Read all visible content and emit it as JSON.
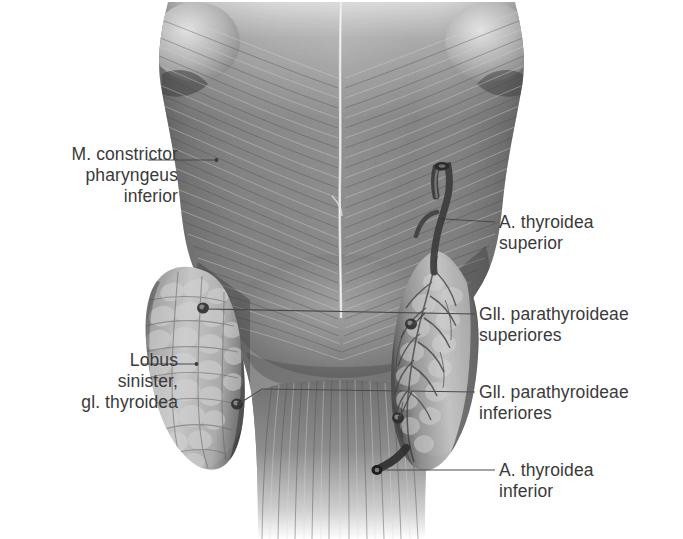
{
  "figure": {
    "type": "anatomical-illustration",
    "view": "posterior view of pharynx and thyroid gland",
    "palette": {
      "background": "#ffffff",
      "label_text": "#3a3a3a",
      "leader_line": "#4a4a4a",
      "muscle_mid": "#7a7a7a",
      "muscle_dark": "#4f4f4f",
      "muscle_light": "#c9c9c9",
      "gland_light": "#b9b9b9",
      "gland_dark": "#555555"
    }
  },
  "labels": [
    {
      "id": "m-constrictor-pharyngeus-inferior",
      "text": "M. constrictor\npharyngeus\ninferior",
      "side": "left",
      "x": 18,
      "y": 144,
      "leader": {
        "from": [
          148,
          160
        ],
        "to": [
          216,
          160
        ]
      }
    },
    {
      "id": "lobus-sinister-gl-thyroidea",
      "text": "Lobus\nsinister,\ngl. thyroidea",
      "side": "left",
      "x": 12,
      "y": 350,
      "leader": {
        "from": [
          142,
          364
        ],
        "to": [
          196,
          364
        ]
      }
    },
    {
      "id": "a-thyroidea-superior",
      "text": "A. thyroidea\nsuperior",
      "side": "right",
      "x": 499,
      "y": 212,
      "leader": {
        "from": [
          467,
          222
        ],
        "to": [
          441,
          219
        ]
      }
    },
    {
      "id": "gll-parathyroideae-superiores",
      "text": "Gll. parathyroideae\nsuperiores",
      "side": "right",
      "x": 479,
      "y": 304,
      "leader": {
        "from": [
          466,
          314
        ],
        "to": [
          203,
          308
        ]
      }
    },
    {
      "id": "gll-parathyroideae-inferiores",
      "text": "Gll. parathyroideae\ninferiores",
      "side": "right",
      "x": 479,
      "y": 382,
      "leader": {
        "from": [
          466,
          392
        ],
        "to": [
          237,
          390
        ]
      }
    },
    {
      "id": "a-thyroidea-inferior",
      "text": "A. thyroidea\ninferior",
      "side": "right",
      "x": 499,
      "y": 460,
      "leader": {
        "from": [
          466,
          470
        ],
        "to": [
          379,
          470
        ]
      }
    }
  ]
}
